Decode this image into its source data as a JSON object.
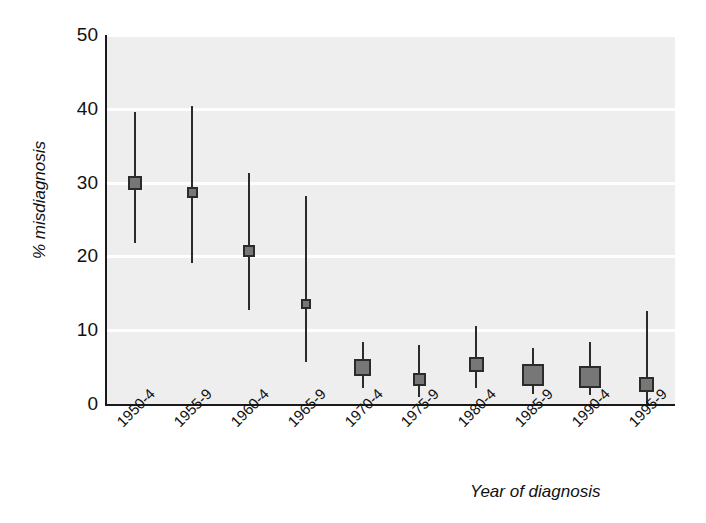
{
  "chart_data": {
    "type": "scatter",
    "title": "",
    "subtitle": "",
    "xlabel": "Year of diagnosis",
    "ylabel": "% misdiagnosis",
    "ylim": [
      0,
      50
    ],
    "yticks": [
      0,
      10,
      20,
      30,
      40,
      50
    ],
    "ytick_labels": [
      "0",
      "10",
      "20",
      "30",
      "40",
      "50"
    ],
    "grid": "horizontal-white-gridlines",
    "legend": "none",
    "categories": [
      "1950-4",
      "1955-9",
      "1960-4",
      "1965-9",
      "1970-4",
      "1975-9",
      "1980-4",
      "1985-9",
      "1990-4",
      "1995-9"
    ],
    "values": [
      30.0,
      28.6,
      20.7,
      13.6,
      4.9,
      3.3,
      5.3,
      3.9,
      3.6,
      2.7
    ],
    "error_low": [
      21.8,
      19.1,
      12.8,
      5.7,
      2.1,
      1.0,
      2.2,
      1.4,
      1.2,
      0.0
    ],
    "error_high": [
      39.5,
      40.4,
      31.3,
      28.2,
      8.4,
      8.0,
      10.6,
      7.6,
      8.4,
      12.6
    ],
    "marker_sizes": [
      14,
      11,
      12,
      10,
      17,
      13,
      15,
      22,
      22,
      15
    ],
    "series": [
      {
        "name": "% misdiagnosis with 95% CI",
        "points": [
          {
            "category": "1950-4",
            "value": 30.0,
            "low": 21.8,
            "high": 39.5
          },
          {
            "category": "1955-9",
            "value": 28.6,
            "low": 19.1,
            "high": 40.4
          },
          {
            "category": "1960-4",
            "value": 20.7,
            "low": 12.8,
            "high": 31.3
          },
          {
            "category": "1965-9",
            "value": 13.6,
            "low": 5.7,
            "high": 28.2
          },
          {
            "category": "1970-4",
            "value": 4.9,
            "low": 2.1,
            "high": 8.4
          },
          {
            "category": "1975-9",
            "value": 3.3,
            "low": 1.0,
            "high": 8.0
          },
          {
            "category": "1980-4",
            "value": 5.3,
            "low": 2.2,
            "high": 10.6
          },
          {
            "category": "1985-9",
            "value": 3.9,
            "low": 1.4,
            "high": 7.6
          },
          {
            "category": "1990-4",
            "value": 3.6,
            "low": 1.2,
            "high": 8.4
          },
          {
            "category": "1995-9",
            "value": 2.7,
            "low": 0.0,
            "high": 12.6
          }
        ]
      }
    ],
    "colors": {
      "plot_background": "#eeeeee",
      "gridline": "#ffffff",
      "marker_fill": "#777777",
      "marker_edge": "#2b2b2b",
      "errorbar": "#2b2b2b",
      "axis": "#1a1a1a",
      "text": "#111111",
      "page_background": "#ffffff"
    }
  }
}
